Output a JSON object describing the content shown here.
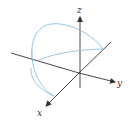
{
  "diagram": {
    "type": "3d-axes-with-curve",
    "axes": {
      "x": {
        "label": "x"
      },
      "y": {
        "label": "y"
      },
      "z": {
        "label": "z"
      }
    },
    "colors": {
      "axis": "#333333",
      "curve": "#8fbfe0",
      "background": "#ffffff"
    }
  }
}
